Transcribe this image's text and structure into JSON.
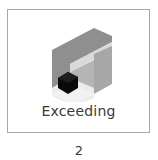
{
  "card": {
    "label": "Exceeding",
    "icon": "isometric-block-icon",
    "colors": {
      "border": "#a8a8a8",
      "dark_face": "#8c8c8c",
      "mid_face": "#a9a9a9",
      "light_band": "#d7d7d7",
      "light_face": "#ebebeb",
      "cube": "#0a0a0a"
    }
  },
  "page_number": "2"
}
